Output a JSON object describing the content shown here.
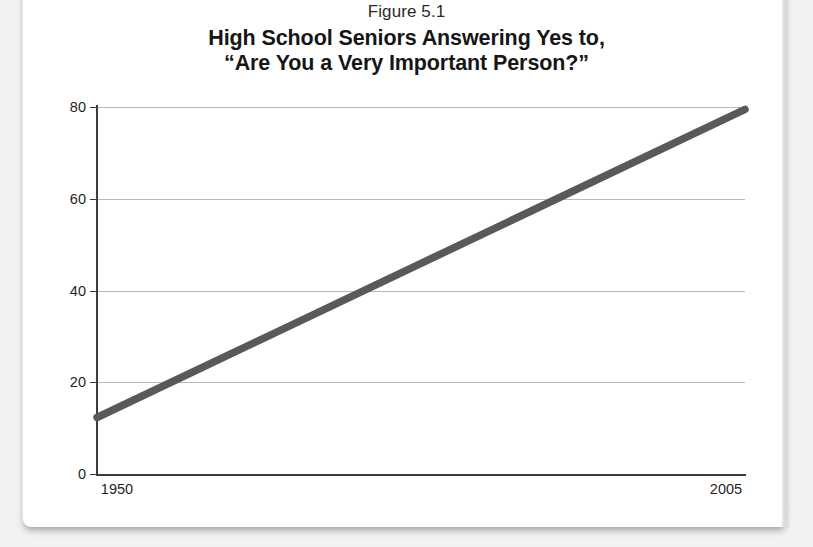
{
  "figure": {
    "number_label": "Figure 5.1",
    "title_line_1": "High School Seniors Answering Yes to,",
    "title_line_2": "“Are You a Very Important Person?”"
  },
  "axes": {
    "y_tick_labels": [
      "80",
      "60",
      "40",
      "20",
      "0"
    ],
    "x_tick_labels": [
      "1950",
      "2005"
    ]
  },
  "colors": {
    "line": "#595959",
    "gridline": "#b9b9b9",
    "axis": "#3c3c3c",
    "text": "#1f1f1f",
    "title": "#161616",
    "card_background": "#ffffff",
    "page_background": "#f2f2f0"
  },
  "chart_data": {
    "type": "line",
    "title": "High School Seniors Answering Yes to, “Are You a Very Important Person?”",
    "subtitle": "Figure 5.1",
    "xlabel": "",
    "ylabel": "",
    "x": [
      1950,
      2005
    ],
    "series": [
      {
        "name": "Percent answering yes",
        "values": [
          12.5,
          79.5
        ]
      }
    ],
    "xlim": [
      1950,
      2005
    ],
    "ylim": [
      0,
      80
    ],
    "x_ticks": [
      1950,
      2005
    ],
    "y_ticks": [
      0,
      20,
      40,
      60,
      80
    ],
    "grid": true,
    "grid_axis": "y",
    "legend": false,
    "annotations": []
  }
}
